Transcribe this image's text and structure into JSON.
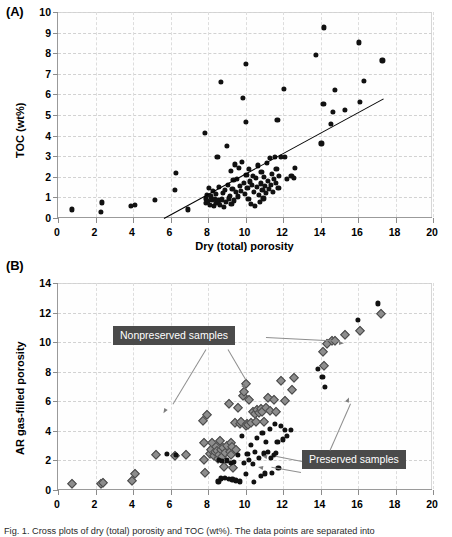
{
  "figure": {
    "caption_partial": "Fig. 1. Cross plots of dry (total) porosity and TOC (wt%). The data points are separated into"
  },
  "panels": [
    {
      "label": "(A)",
      "xlabel": "Dry (total) porosity",
      "ylabel": "TOC (wt%)",
      "xticks": [
        0,
        2,
        4,
        6,
        8,
        10,
        12,
        14,
        16,
        18,
        20
      ],
      "yticks": [
        0,
        1,
        2,
        3,
        4,
        5,
        6,
        7,
        8,
        9,
        10
      ]
    },
    {
      "label": "(B)",
      "xlabel": "Dry (total) porosity",
      "ylabel": "AR gas-filled porosity",
      "xticks": [
        0,
        2,
        4,
        6,
        8,
        10,
        12,
        14,
        16,
        18,
        20
      ],
      "yticks": [
        0,
        2,
        4,
        6,
        8,
        10,
        12,
        14
      ]
    }
  ],
  "annotations": {
    "nonpreserved_label": "Nonpreserved samples",
    "preserved_label": "Preserved samples"
  },
  "chart_data": [
    {
      "type": "scatter",
      "panel": "(A)",
      "title": "",
      "xlabel": "Dry (total) porosity",
      "ylabel": "TOC (wt%)",
      "xlim": [
        0,
        20
      ],
      "ylim": [
        0,
        10
      ],
      "xticks": [
        0,
        2,
        4,
        6,
        8,
        10,
        12,
        14,
        16,
        18,
        20
      ],
      "yticks": [
        0,
        1,
        2,
        3,
        4,
        5,
        6,
        7,
        8,
        9,
        10
      ],
      "grid": "dashed-both",
      "legend": "none",
      "marker": "filled-circle-black",
      "trendline": {
        "x0": 5.65,
        "y0": 0.0,
        "x1": 17.35,
        "y1": 5.8
      },
      "points": [
        [
          0.72,
          0.42
        ],
        [
          2.28,
          0.3
        ],
        [
          2.35,
          0.76
        ],
        [
          3.9,
          0.6
        ],
        [
          4.08,
          0.62
        ],
        [
          5.15,
          0.86
        ],
        [
          6.25,
          1.35
        ],
        [
          6.3,
          2.18
        ],
        [
          6.92,
          0.42
        ],
        [
          7.82,
          4.13
        ],
        [
          7.88,
          0.95
        ],
        [
          7.9,
          0.72
        ],
        [
          7.95,
          1.12
        ],
        [
          8.0,
          0.82
        ],
        [
          8.05,
          1.45
        ],
        [
          8.1,
          0.65
        ],
        [
          8.15,
          1.05
        ],
        [
          8.2,
          0.88
        ],
        [
          8.25,
          1.3
        ],
        [
          8.3,
          0.58
        ],
        [
          8.35,
          0.93
        ],
        [
          8.4,
          1.18
        ],
        [
          8.45,
          0.72
        ],
        [
          8.5,
          2.95
        ],
        [
          8.55,
          0.85
        ],
        [
          8.6,
          1.5
        ],
        [
          8.62,
          0.62
        ],
        [
          8.7,
          6.6
        ],
        [
          8.75,
          0.9
        ],
        [
          8.8,
          1.22
        ],
        [
          8.85,
          0.55
        ],
        [
          8.9,
          1.38
        ],
        [
          8.95,
          0.78
        ],
        [
          9.0,
          3.5
        ],
        [
          9.05,
          1.62
        ],
        [
          9.1,
          0.95
        ],
        [
          9.15,
          1.08
        ],
        [
          9.2,
          2.28
        ],
        [
          9.25,
          0.7
        ],
        [
          9.3,
          1.42
        ],
        [
          9.35,
          1.85
        ],
        [
          9.4,
          0.85
        ],
        [
          9.45,
          2.6
        ],
        [
          9.5,
          1.25
        ],
        [
          9.55,
          1.9
        ],
        [
          9.6,
          1.05
        ],
        [
          9.65,
          2.45
        ],
        [
          9.7,
          1.55
        ],
        [
          9.75,
          1.32
        ],
        [
          9.8,
          2.72
        ],
        [
          9.85,
          5.82
        ],
        [
          9.9,
          1.7
        ],
        [
          9.95,
          1.15
        ],
        [
          10.0,
          7.47
        ],
        [
          10.02,
          4.68
        ],
        [
          10.05,
          2.1
        ],
        [
          10.1,
          1.48
        ],
        [
          10.15,
          0.92
        ],
        [
          10.2,
          2.38
        ],
        [
          10.25,
          1.78
        ],
        [
          10.3,
          0.68
        ],
        [
          10.35,
          1.62
        ],
        [
          10.4,
          2.05
        ],
        [
          10.45,
          1.28
        ],
        [
          10.5,
          0.6
        ],
        [
          10.55,
          1.95
        ],
        [
          10.6,
          1.5
        ],
        [
          10.65,
          2.55
        ],
        [
          10.7,
          1.12
        ],
        [
          10.75,
          0.78
        ],
        [
          10.8,
          1.68
        ],
        [
          10.85,
          2.22
        ],
        [
          10.9,
          1.38
        ],
        [
          10.95,
          0.95
        ],
        [
          11.0,
          2.0
        ],
        [
          11.05,
          1.55
        ],
        [
          11.1,
          1.2
        ],
        [
          11.15,
          2.68
        ],
        [
          11.2,
          1.82
        ],
        [
          11.25,
          1.42
        ],
        [
          11.3,
          2.92
        ],
        [
          11.35,
          1.62
        ],
        [
          11.4,
          2.15
        ],
        [
          11.45,
          1.25
        ],
        [
          11.5,
          1.88
        ],
        [
          11.55,
          2.98
        ],
        [
          11.6,
          1.7
        ],
        [
          11.65,
          2.4
        ],
        [
          11.7,
          4.78
        ],
        [
          11.75,
          1.45
        ],
        [
          11.8,
          2.05
        ],
        [
          11.9,
          2.95
        ],
        [
          12.05,
          6.25
        ],
        [
          12.1,
          2.98
        ],
        [
          12.2,
          1.88
        ],
        [
          12.45,
          2.05
        ],
        [
          12.6,
          1.95
        ],
        [
          12.65,
          2.42
        ],
        [
          13.75,
          7.9
        ],
        [
          14.05,
          3.62
        ],
        [
          14.15,
          5.55
        ],
        [
          14.2,
          9.25
        ],
        [
          14.55,
          4.58
        ],
        [
          14.65,
          5.15
        ],
        [
          14.75,
          6.22
        ],
        [
          15.3,
          5.25
        ],
        [
          16.05,
          8.52
        ],
        [
          16.1,
          5.65
        ],
        [
          16.3,
          6.65
        ],
        [
          17.3,
          7.65
        ]
      ]
    },
    {
      "type": "scatter",
      "panel": "(B)",
      "title": "",
      "xlabel": "Dry (total) porosity",
      "ylabel": "AR gas-filled porosity",
      "xlim": [
        0,
        20
      ],
      "ylim": [
        0,
        14
      ],
      "xticks": [
        0,
        2,
        4,
        6,
        8,
        10,
        12,
        14,
        16,
        18,
        20
      ],
      "yticks": [
        0,
        2,
        4,
        6,
        8,
        10,
        12,
        14
      ],
      "grid": "dashed-both",
      "legend": "in-plot-callouts",
      "series": [
        {
          "name": "Nonpreserved samples",
          "marker": "gray-diamond",
          "color": "#8d8d8d",
          "points": [
            [
              0.72,
              0.38
            ],
            [
              2.3,
              0.42
            ],
            [
              2.42,
              0.45
            ],
            [
              3.95,
              0.62
            ],
            [
              4.1,
              1.08
            ],
            [
              5.2,
              2.4
            ],
            [
              6.25,
              2.32
            ],
            [
              6.85,
              2.35
            ],
            [
              7.72,
              4.68
            ],
            [
              7.78,
              3.18
            ],
            [
              7.8,
              2.0
            ],
            [
              7.82,
              1.12
            ],
            [
              7.95,
              5.08
            ],
            [
              8.1,
              2.45
            ],
            [
              8.15,
              2.7
            ],
            [
              8.2,
              3.2
            ],
            [
              8.3,
              2.3
            ],
            [
              8.38,
              2.55
            ],
            [
              8.45,
              2.9
            ],
            [
              8.5,
              2.62
            ],
            [
              8.55,
              2.12
            ],
            [
              8.6,
              2.38
            ],
            [
              8.65,
              3.3
            ],
            [
              8.7,
              2.72
            ],
            [
              8.75,
              2.25
            ],
            [
              8.8,
              2.82
            ],
            [
              8.85,
              1.55
            ],
            [
              8.9,
              2.48
            ],
            [
              9.0,
              2.95
            ],
            [
              9.1,
              5.85
            ],
            [
              9.15,
              2.6
            ],
            [
              9.2,
              3.15
            ],
            [
              9.25,
              2.35
            ],
            [
              9.3,
              2.88
            ],
            [
              9.35,
              1.48
            ],
            [
              9.45,
              4.52
            ],
            [
              9.5,
              2.7
            ],
            [
              9.6,
              5.55
            ],
            [
              9.7,
              4.45
            ],
            [
              9.75,
              4.58
            ],
            [
              9.85,
              6.35
            ],
            [
              9.9,
              6.62
            ],
            [
              10.0,
              4.35
            ],
            [
              10.05,
              7.2
            ],
            [
              10.1,
              4.48
            ],
            [
              10.15,
              4.38
            ],
            [
              10.2,
              6.1
            ],
            [
              10.3,
              4.52
            ],
            [
              10.4,
              5.25
            ],
            [
              10.5,
              5.12
            ],
            [
              10.55,
              4.58
            ],
            [
              10.6,
              5.38
            ],
            [
              10.7,
              5.18
            ],
            [
              10.8,
              5.45
            ],
            [
              10.9,
              5.3
            ],
            [
              11.0,
              4.62
            ],
            [
              11.1,
              5.52
            ],
            [
              11.2,
              6.2
            ],
            [
              11.3,
              5.35
            ],
            [
              11.5,
              6.12
            ],
            [
              11.6,
              5.25
            ],
            [
              11.9,
              7.35
            ],
            [
              12.1,
              6.05
            ],
            [
              12.5,
              6.78
            ],
            [
              12.6,
              7.6
            ],
            [
              14.15,
              9.35
            ],
            [
              14.2,
              8.38
            ],
            [
              14.35,
              9.85
            ],
            [
              14.6,
              10.05
            ],
            [
              14.75,
              10.1
            ],
            [
              15.3,
              10.5
            ],
            [
              16.1,
              10.78
            ],
            [
              17.25,
              11.92
            ]
          ]
        },
        {
          "name": "Preserved samples",
          "marker": "black-circle",
          "color": "#111111",
          "points": [
            [
              5.8,
              2.42
            ],
            [
              6.3,
              2.35
            ],
            [
              8.55,
              0.58
            ],
            [
              8.6,
              2.05
            ],
            [
              8.7,
              0.78
            ],
            [
              8.75,
              1.95
            ],
            [
              8.9,
              0.82
            ],
            [
              9.0,
              2.0
            ],
            [
              9.1,
              0.75
            ],
            [
              9.2,
              1.85
            ],
            [
              9.3,
              0.72
            ],
            [
              9.4,
              1.9
            ],
            [
              9.5,
              0.65
            ],
            [
              9.6,
              2.35
            ],
            [
              9.7,
              0.58
            ],
            [
              9.8,
              3.68
            ],
            [
              9.9,
              1.82
            ],
            [
              10.0,
              1.08
            ],
            [
              10.1,
              2.45
            ],
            [
              10.2,
              2.05
            ],
            [
              10.3,
              3.05
            ],
            [
              10.4,
              1.78
            ],
            [
              10.45,
              0.55
            ],
            [
              10.5,
              2.6
            ],
            [
              10.6,
              3.55
            ],
            [
              10.7,
              2.15
            ],
            [
              10.8,
              0.95
            ],
            [
              10.9,
              3.85
            ],
            [
              11.0,
              2.48
            ],
            [
              11.05,
              1.12
            ],
            [
              11.1,
              3.25
            ],
            [
              11.2,
              2.55
            ],
            [
              11.3,
              4.15
            ],
            [
              11.35,
              2.18
            ],
            [
              11.4,
              1.15
            ],
            [
              11.5,
              2.35
            ],
            [
              11.55,
              4.45
            ],
            [
              11.6,
              2.52
            ],
            [
              11.7,
              3.28
            ],
            [
              11.75,
              1.5
            ],
            [
              11.9,
              4.32
            ],
            [
              12.0,
              3.42
            ],
            [
              12.1,
              4.05
            ],
            [
              12.2,
              3.68
            ],
            [
              12.4,
              4.08
            ],
            [
              13.85,
              8.18
            ],
            [
              14.1,
              7.65
            ],
            [
              14.25,
              6.95
            ],
            [
              16.0,
              11.5
            ],
            [
              17.05,
              12.62
            ]
          ]
        }
      ]
    }
  ]
}
